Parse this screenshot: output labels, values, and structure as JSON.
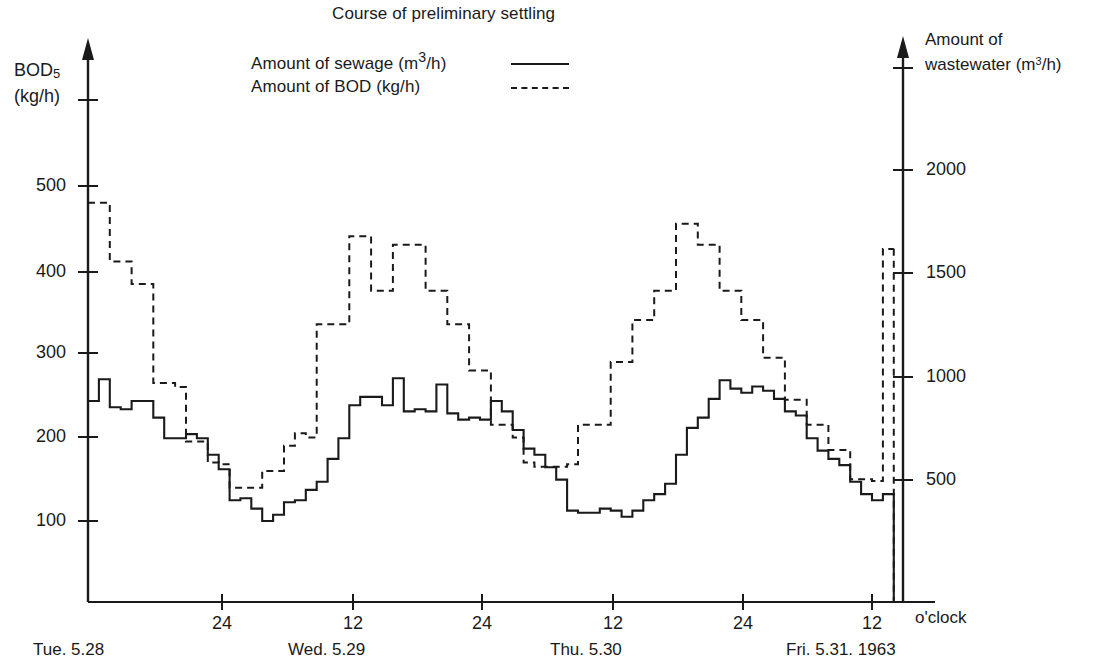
{
  "chart_data": {
    "type": "line",
    "title": "Course of preliminary settling",
    "subtitle": "",
    "xlabel": "o'clock",
    "ylabel": "BOD5 (kg/h)",
    "y2label": "Amount of wastewater (m3/h)",
    "grid": false,
    "legend_position": "top-center",
    "x_unit_note": "o'clock",
    "axes": {
      "left": {
        "title_line1": "BOD",
        "title_sub": "5",
        "title_line2": "(kg/h)",
        "ticks": [
          100,
          200,
          300,
          400,
          500
        ],
        "tick_labels": [
          "100",
          "200",
          "300",
          "400",
          "500"
        ],
        "ylim": [
          0,
          600
        ]
      },
      "right": {
        "title_line1": "Amount of",
        "title_line2_pre": "wastewater (m",
        "title_line2_sup": "3",
        "title_line2_post": "/h)",
        "ticks": [
          500,
          1000,
          1500,
          2000
        ],
        "tick_labels": [
          "500",
          "1000",
          "1500",
          "2000"
        ],
        "ylim": [
          0,
          2500
        ]
      },
      "x": {
        "tick_labels": [
          "24",
          "12",
          "24",
          "12",
          "24",
          "12"
        ],
        "tick_hours": [
          24,
          36,
          48,
          60,
          72,
          84
        ],
        "xlim_hours": [
          12,
          86
        ],
        "day_labels": [
          {
            "text": "Tue. 5.28",
            "hour": 18
          },
          {
            "text": "Wed. 5.29",
            "hour": 36
          },
          {
            "text": "Thu. 5.30",
            "hour": 60
          },
          {
            "text": "Fri. 5.31. 1963",
            "hour": 83
          }
        ]
      }
    },
    "legend": [
      {
        "name": "Amount of sewage (m3/h)",
        "label_pre": "Amount of sewage (m",
        "label_sup": "3",
        "label_post": "/h)",
        "style": "solid",
        "axis": "right"
      },
      {
        "name": "Amount of BOD (kg/h)",
        "label_pre": "Amount of BOD (kg/h)",
        "label_sup": "",
        "label_post": "",
        "style": "dashed",
        "axis": "left"
      }
    ],
    "series": [
      {
        "name": "Amount of sewage (m3/h)",
        "style": "solid",
        "axis": "right",
        "unit": "m3/h",
        "step": true,
        "x_hours": [
          12,
          13,
          14,
          15,
          16,
          17,
          18,
          19,
          20,
          21,
          22,
          23,
          24,
          25,
          26,
          27,
          28,
          29,
          30,
          31,
          32,
          33,
          34,
          35,
          36,
          37,
          38,
          39,
          40,
          41,
          42,
          43,
          44,
          45,
          46,
          47,
          48,
          49,
          50,
          51,
          52,
          53,
          54,
          55,
          56,
          57,
          58,
          59,
          60,
          61,
          62,
          63,
          64,
          65,
          66,
          67,
          68,
          69,
          70,
          71,
          72,
          73,
          74,
          75,
          76,
          77,
          78,
          79,
          80,
          81,
          82,
          83,
          84,
          85,
          86
        ],
        "values": [
          880,
          985,
          850,
          840,
          880,
          880,
          800,
          700,
          700,
          720,
          700,
          620,
          550,
          400,
          410,
          360,
          300,
          330,
          390,
          400,
          450,
          490,
          600,
          700,
          860,
          900,
          900,
          860,
          990,
          830,
          840,
          830,
          960,
          820,
          790,
          800,
          790,
          880,
          830,
          740,
          650,
          620,
          560,
          500,
          350,
          340,
          340,
          360,
          350,
          320,
          350,
          400,
          430,
          480,
          620,
          750,
          800,
          890,
          980,
          940,
          920,
          950,
          930,
          890,
          830,
          810,
          700,
          640,
          600,
          570,
          490,
          430,
          400,
          430,
          370
        ]
      },
      {
        "name": "Amount of BOD (kg/h)",
        "style": "dashed",
        "axis": "left",
        "unit": "kg/h",
        "step": true,
        "x_hours": [
          12,
          13,
          14,
          15,
          16,
          17,
          18,
          19,
          20,
          21,
          22,
          23,
          24,
          25,
          26,
          27,
          28,
          29,
          30,
          31,
          32,
          33,
          34,
          35,
          36,
          37,
          38,
          39,
          40,
          41,
          42,
          43,
          44,
          45,
          46,
          47,
          48,
          49,
          50,
          51,
          52,
          53,
          54,
          55,
          56,
          57,
          58,
          59,
          60,
          61,
          62,
          63,
          64,
          65,
          66,
          67,
          68,
          69,
          70,
          71,
          72,
          73,
          74,
          75,
          76,
          77,
          78,
          79,
          80,
          81,
          82,
          83,
          84,
          85,
          86
        ],
        "values": [
          480,
          480,
          410,
          410,
          383,
          383,
          265,
          265,
          260,
          195,
          195,
          170,
          168,
          140,
          140,
          140,
          160,
          160,
          190,
          205,
          200,
          335,
          335,
          335,
          440,
          440,
          375,
          375,
          430,
          430,
          430,
          375,
          375,
          335,
          335,
          280,
          280,
          215,
          215,
          200,
          170,
          165,
          165,
          165,
          168,
          215,
          215,
          215,
          290,
          290,
          340,
          340,
          375,
          375,
          455,
          455,
          430,
          430,
          375,
          375,
          340,
          340,
          295,
          295,
          245,
          245,
          215,
          215,
          185,
          185,
          150,
          150,
          148,
          425,
          425
        ]
      }
    ],
    "annotations": []
  },
  "chart": {
    "title": "Course of preliminary settling",
    "legend": {
      "sewage": {
        "pre": "Amount of sewage (m",
        "sup": "3",
        "post": "/h)"
      },
      "bod": {
        "text": "Amount of BOD (kg/h)"
      }
    },
    "left_axis": {
      "title1_main": "BOD",
      "title1_sub": "5",
      "title2": "(kg/h)",
      "t100": "100",
      "t200": "200",
      "t300": "300",
      "t400": "400",
      "t500": "500"
    },
    "right_axis": {
      "title1": "Amount of",
      "title2_pre": "wastewater (m",
      "title2_sup": "3",
      "title2_post": "/h)",
      "t500": "500",
      "t1000": "1000",
      "t1500": "1500",
      "t2000": "2000"
    },
    "x_axis": {
      "tick1": "24",
      "tick2": "12",
      "tick3": "24",
      "tick4": "12",
      "tick5": "24",
      "tick6": "12",
      "unit": "o'clock",
      "day1": "Tue. 5.28",
      "day2": "Wed. 5.29",
      "day3": "Thu. 5.30",
      "day4": "Fri. 5.31. 1963"
    },
    "colors": {
      "ink": "#1a1a1a",
      "background": "#ffffff"
    }
  }
}
